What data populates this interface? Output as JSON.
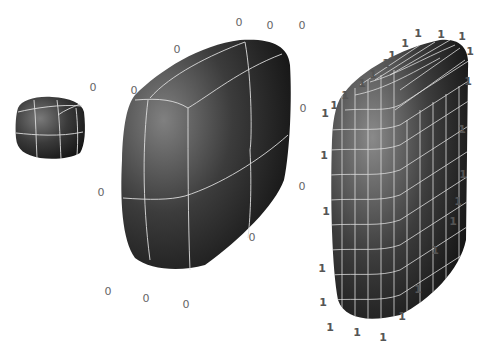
{
  "figure": {
    "shapes": [
      {
        "name": "small-rounded-cube",
        "grid": "3x3"
      },
      {
        "name": "large-rounded-box-coarse",
        "grid": "3x3",
        "vertex_weight": "0"
      },
      {
        "name": "rounded-box-fine",
        "grid": "dense",
        "vertex_weight": "1"
      }
    ],
    "labels_zero": [
      {
        "x": 239,
        "y": 22,
        "t": "0"
      },
      {
        "x": 270,
        "y": 25,
        "t": "0"
      },
      {
        "x": 302,
        "y": 25,
        "t": "0"
      },
      {
        "x": 177,
        "y": 49,
        "t": "0"
      },
      {
        "x": 93,
        "y": 87,
        "t": "0"
      },
      {
        "x": 134,
        "y": 90,
        "t": "0"
      },
      {
        "x": 303,
        "y": 108,
        "t": "0"
      },
      {
        "x": 101,
        "y": 192,
        "t": "0"
      },
      {
        "x": 302,
        "y": 186,
        "t": "0"
      },
      {
        "x": 252,
        "y": 237,
        "t": "0"
      },
      {
        "x": 108,
        "y": 291,
        "t": "0"
      },
      {
        "x": 146,
        "y": 298,
        "t": "0"
      },
      {
        "x": 186,
        "y": 304,
        "t": "0"
      }
    ],
    "labels_one": [
      {
        "x": 418,
        "y": 33,
        "t": "1"
      },
      {
        "x": 441,
        "y": 34,
        "t": "1"
      },
      {
        "x": 462,
        "y": 36,
        "t": "1"
      },
      {
        "x": 470,
        "y": 51,
        "t": "1"
      },
      {
        "x": 405,
        "y": 43,
        "t": "1"
      },
      {
        "x": 392,
        "y": 55,
        "t": "1"
      },
      {
        "x": 386,
        "y": 63,
        "t": "1"
      },
      {
        "x": 373,
        "y": 74,
        "t": "1"
      },
      {
        "x": 362,
        "y": 83,
        "t": "1"
      },
      {
        "x": 345,
        "y": 95,
        "t": "1"
      },
      {
        "x": 334,
        "y": 105,
        "t": "1"
      },
      {
        "x": 325,
        "y": 113,
        "t": "1"
      },
      {
        "x": 468,
        "y": 81,
        "t": "1"
      },
      {
        "x": 462,
        "y": 129,
        "t": "1"
      },
      {
        "x": 324,
        "y": 155,
        "t": "1"
      },
      {
        "x": 463,
        "y": 174,
        "t": "1"
      },
      {
        "x": 458,
        "y": 201,
        "t": "1"
      },
      {
        "x": 326,
        "y": 211,
        "t": "1"
      },
      {
        "x": 453,
        "y": 221,
        "t": "1"
      },
      {
        "x": 435,
        "y": 250,
        "t": "1"
      },
      {
        "x": 322,
        "y": 268,
        "t": "1"
      },
      {
        "x": 418,
        "y": 289,
        "t": "1"
      },
      {
        "x": 323,
        "y": 302,
        "t": "1"
      },
      {
        "x": 402,
        "y": 316,
        "t": "1"
      },
      {
        "x": 330,
        "y": 327,
        "t": "1"
      },
      {
        "x": 357,
        "y": 332,
        "t": "1"
      },
      {
        "x": 383,
        "y": 337,
        "t": "1"
      }
    ]
  }
}
